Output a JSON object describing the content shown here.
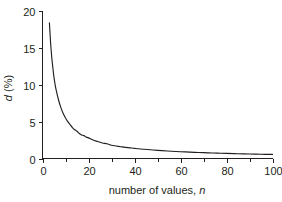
{
  "chart_data": {
    "type": "line",
    "title": "",
    "subtitle": "",
    "xlabel": "number of values, n",
    "xlabel_plain": "number of values, ",
    "xlabel_italic": "n",
    "ylabel": "d (%)",
    "ylabel_italic": "d",
    "ylabel_plain": " (%)",
    "xlim": [
      0,
      100
    ],
    "ylim": [
      0,
      20
    ],
    "x_ticks": [
      0,
      20,
      40,
      60,
      80,
      100
    ],
    "x_tick_labels": [
      "0",
      "20",
      "40",
      "60",
      "80",
      "100"
    ],
    "x_minor_ticks": [
      10,
      30,
      50,
      70,
      90
    ],
    "y_ticks": [
      0,
      5,
      10,
      15,
      20
    ],
    "y_tick_labels": [
      "0",
      "5",
      "10",
      "15",
      "20"
    ],
    "y_minor_ticks": [],
    "grid": false,
    "legend": false,
    "legend_position": "none",
    "curve_color": "#231f20",
    "axis_color": "#231f20",
    "background_color": "#ffffff",
    "series": [
      {
        "name": "d",
        "x": [
          3,
          3.5,
          4,
          4.5,
          5,
          5.5,
          6,
          7,
          8,
          9,
          10,
          11,
          12,
          13,
          14,
          15,
          16,
          17,
          18,
          19,
          20,
          22,
          24,
          26,
          28,
          30,
          32,
          34,
          36,
          38,
          40,
          44,
          48,
          52,
          56,
          60,
          64,
          68,
          72,
          76,
          80,
          85,
          90,
          95,
          100
        ],
        "y": [
          18.4,
          15.8,
          13.8,
          12.3,
          11.0,
          10.0,
          9.2,
          7.9,
          6.9,
          6.1,
          5.5,
          5.0,
          4.6,
          4.2,
          3.9,
          3.7,
          3.4,
          3.2,
          3.1,
          2.9,
          2.8,
          2.5,
          2.3,
          2.1,
          2.0,
          1.8,
          1.7,
          1.6,
          1.5,
          1.45,
          1.38,
          1.25,
          1.15,
          1.06,
          0.98,
          0.92,
          0.86,
          0.81,
          0.77,
          0.73,
          0.69,
          0.65,
          0.61,
          0.58,
          0.55
        ]
      }
    ],
    "annotations": []
  }
}
